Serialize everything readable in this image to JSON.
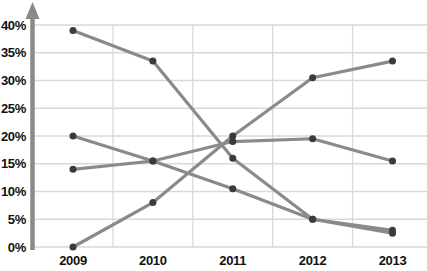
{
  "chart_data": {
    "type": "line",
    "title": "",
    "xlabel": "",
    "ylabel": "",
    "categories": [
      "2009",
      "2010",
      "2011",
      "2012",
      "2013"
    ],
    "series": [
      {
        "name": "series-1",
        "values": [
          39,
          33.5,
          16,
          5,
          3
        ]
      },
      {
        "name": "series-2",
        "values": [
          20,
          15.5,
          10.5,
          5,
          2.5
        ]
      },
      {
        "name": "series-3",
        "values": [
          14,
          15.5,
          19,
          19.5,
          15.5
        ]
      },
      {
        "name": "series-4",
        "values": [
          0,
          8,
          20,
          30.5,
          33.5
        ]
      }
    ],
    "y_ticks": [
      {
        "value": 0,
        "label": "0%"
      },
      {
        "value": 5,
        "label": "5%"
      },
      {
        "value": 10,
        "label": "10%"
      },
      {
        "value": 15,
        "label": "15%"
      },
      {
        "value": 20,
        "label": "20%"
      },
      {
        "value": 25,
        "label": "25%"
      },
      {
        "value": 30,
        "label": "30%"
      },
      {
        "value": 35,
        "label": "35%"
      },
      {
        "value": 40,
        "label": "40%"
      }
    ],
    "ylim": [
      0,
      40
    ],
    "grid": true,
    "legend": "none",
    "colors": {
      "line": "#8a8a8a",
      "marker": "#3b3b3b",
      "grid": "#d9d9d9",
      "axis": "#8a8a8a",
      "label": "#111111",
      "background": "#ffffff"
    }
  }
}
